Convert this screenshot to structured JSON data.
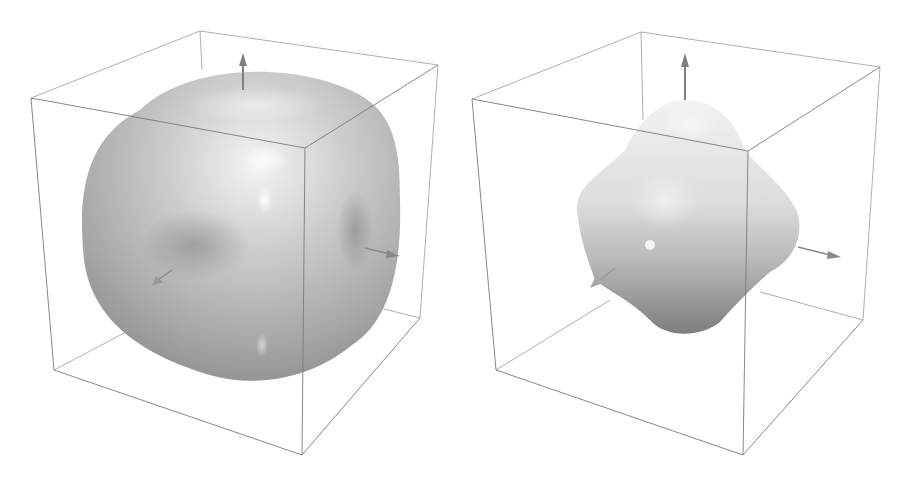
{
  "figure": {
    "panels": [
      {
        "id": "left",
        "description": "Rounded cube-like surface (isosurface) inside a bounding box with three axis arrows",
        "surface_color": "#b8b8b8",
        "box_line_color": "#8a8a8a",
        "arrow_color": "#7f7f7f"
      },
      {
        "id": "right",
        "description": "Octahedron-like lobed surface inside a bounding box with three axis arrows",
        "surface_color": "#c4c4c4",
        "box_line_color": "#8a8a8a",
        "arrow_color": "#7f7f7f"
      }
    ]
  }
}
